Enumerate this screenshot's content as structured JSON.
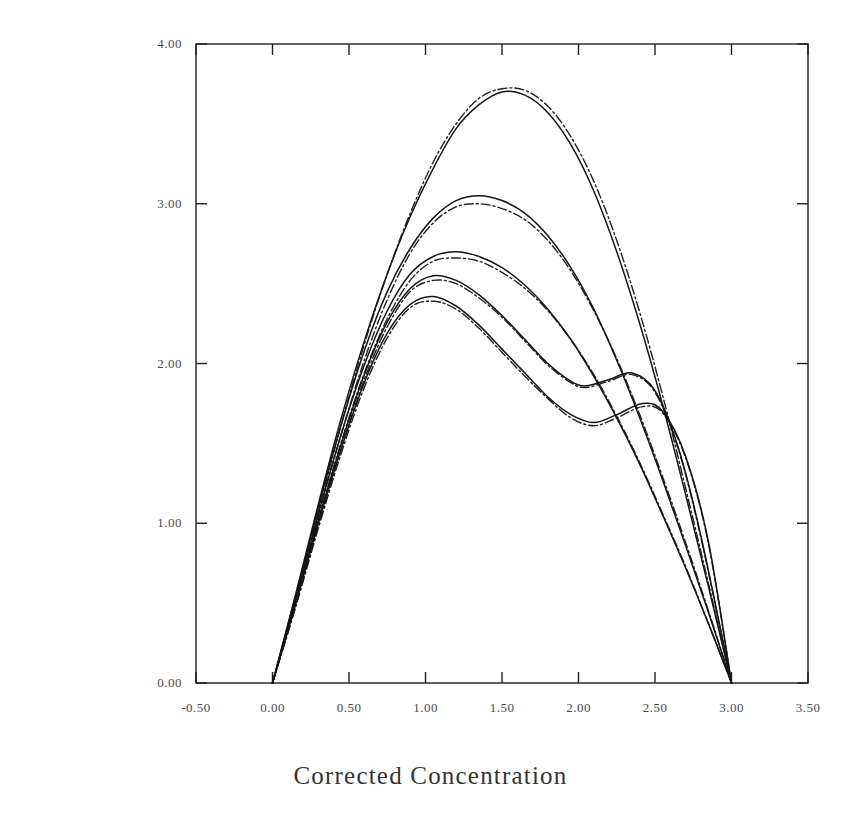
{
  "figure": {
    "name": "corrected-derivative-plot",
    "background_color": "#ffffff",
    "ink_color": "#1a1a1a"
  },
  "chart_data": {
    "type": "line",
    "title": "",
    "xlabel": "Corrected Concentration",
    "ylabel": "Corrected Derivative x 10~--3",
    "xlim": [
      -0.5,
      3.5
    ],
    "ylim": [
      0.0,
      4.0
    ],
    "xticks": [
      "-0.50",
      "0.00",
      "0.50",
      "1.00",
      "1.50",
      "2.00",
      "2.50",
      "3.00",
      "3.50"
    ],
    "xtick_values": [
      -0.5,
      0.0,
      0.5,
      1.0,
      1.5,
      2.0,
      2.5,
      3.0,
      3.5
    ],
    "yticks": [
      "0.00",
      "1.00",
      "2.00",
      "3.00",
      "4.00"
    ],
    "ytick_values": [
      0.0,
      1.0,
      2.0,
      3.0,
      4.0
    ],
    "grid": false,
    "legend": "none",
    "axis_frame": "full-box",
    "series": [
      {
        "name": "curve-1-data",
        "style": "solid",
        "peak_x": 1.55,
        "peak_y": 3.7,
        "x": [
          0.0,
          0.15,
          0.3,
          0.45,
          0.6,
          0.75,
          0.9,
          1.05,
          1.2,
          1.35,
          1.5,
          1.65,
          1.8,
          1.95,
          2.1,
          2.25,
          2.4,
          2.55,
          2.7,
          2.85,
          3.0
        ],
        "y": [
          0.0,
          0.55,
          1.12,
          1.66,
          2.14,
          2.56,
          2.92,
          3.22,
          3.47,
          3.62,
          3.7,
          3.68,
          3.57,
          3.37,
          3.08,
          2.7,
          2.25,
          1.74,
          1.18,
          0.6,
          0.0
        ]
      },
      {
        "name": "curve-1-fit",
        "style": "dashed",
        "peak_x": 1.58,
        "peak_y": 3.72,
        "x": [
          0.0,
          0.15,
          0.3,
          0.45,
          0.6,
          0.75,
          0.9,
          1.05,
          1.2,
          1.35,
          1.5,
          1.65,
          1.8,
          1.95,
          2.1,
          2.25,
          2.4,
          2.55,
          2.7,
          2.85,
          3.0
        ],
        "y": [
          0.0,
          0.52,
          1.08,
          1.62,
          2.12,
          2.56,
          2.94,
          3.26,
          3.5,
          3.66,
          3.72,
          3.71,
          3.61,
          3.42,
          3.14,
          2.77,
          2.32,
          1.8,
          1.22,
          0.62,
          0.0
        ]
      },
      {
        "name": "curve-2-data",
        "style": "solid",
        "peak_x": 1.35,
        "peak_y": 3.05,
        "x": [
          0.0,
          0.15,
          0.3,
          0.45,
          0.6,
          0.75,
          0.9,
          1.05,
          1.2,
          1.35,
          1.5,
          1.65,
          1.8,
          1.95,
          2.1,
          2.25,
          2.4,
          2.55,
          2.7,
          2.85,
          3.0
        ],
        "y": [
          0.0,
          0.54,
          1.1,
          1.62,
          2.08,
          2.45,
          2.72,
          2.91,
          3.02,
          3.05,
          3.02,
          2.94,
          2.8,
          2.6,
          2.34,
          2.02,
          1.66,
          1.27,
          0.86,
          0.44,
          0.0
        ]
      },
      {
        "name": "curve-2-fit",
        "style": "dashed",
        "peak_x": 1.4,
        "peak_y": 3.0,
        "x": [
          0.0,
          0.15,
          0.3,
          0.45,
          0.6,
          0.75,
          0.9,
          1.05,
          1.2,
          1.35,
          1.5,
          1.65,
          1.8,
          1.95,
          2.1,
          2.25,
          2.4,
          2.55,
          2.7,
          2.85,
          3.0
        ],
        "y": [
          0.0,
          0.51,
          1.05,
          1.56,
          2.02,
          2.4,
          2.69,
          2.88,
          2.98,
          3.0,
          2.97,
          2.9,
          2.77,
          2.58,
          2.33,
          2.03,
          1.68,
          1.29,
          0.88,
          0.45,
          0.0
        ]
      },
      {
        "name": "curve-3-data",
        "style": "solid",
        "peak_x": 1.2,
        "peak_y": 2.7,
        "x": [
          0.0,
          0.15,
          0.3,
          0.45,
          0.6,
          0.75,
          0.9,
          1.05,
          1.2,
          1.35,
          1.5,
          1.65,
          1.8,
          1.95,
          2.1,
          2.25,
          2.4,
          2.55,
          2.7,
          2.85,
          3.0
        ],
        "y": [
          0.0,
          0.52,
          1.06,
          1.56,
          1.99,
          2.33,
          2.56,
          2.67,
          2.7,
          2.67,
          2.6,
          2.49,
          2.34,
          2.15,
          1.92,
          1.66,
          1.37,
          1.05,
          0.72,
          0.37,
          0.0
        ]
      },
      {
        "name": "curve-3-fit",
        "style": "dashed",
        "peak_x": 1.25,
        "peak_y": 2.66,
        "x": [
          0.0,
          0.15,
          0.3,
          0.45,
          0.6,
          0.75,
          0.9,
          1.05,
          1.2,
          1.35,
          1.5,
          1.65,
          1.8,
          1.95,
          2.1,
          2.25,
          2.4,
          2.55,
          2.7,
          2.85,
          3.0
        ],
        "y": [
          0.0,
          0.5,
          1.02,
          1.51,
          1.94,
          2.28,
          2.52,
          2.64,
          2.66,
          2.64,
          2.57,
          2.47,
          2.33,
          2.15,
          1.93,
          1.67,
          1.38,
          1.06,
          0.73,
          0.37,
          0.0
        ]
      },
      {
        "name": "curve-4-data",
        "style": "solid",
        "peak_x": 1.1,
        "peak_y": 2.55,
        "shoulder_min_x": 2.05,
        "shoulder_min_y": 1.86,
        "shoulder_max_x": 2.35,
        "shoulder_max_y": 1.94,
        "x": [
          0.0,
          0.15,
          0.3,
          0.45,
          0.6,
          0.75,
          0.9,
          1.05,
          1.2,
          1.35,
          1.5,
          1.65,
          1.8,
          1.95,
          2.05,
          2.2,
          2.35,
          2.5,
          2.65,
          2.8,
          3.0
        ],
        "y": [
          0.0,
          0.5,
          1.02,
          1.5,
          1.93,
          2.26,
          2.47,
          2.55,
          2.52,
          2.43,
          2.3,
          2.15,
          2.0,
          1.89,
          1.86,
          1.9,
          1.94,
          1.83,
          1.48,
          0.92,
          0.0
        ]
      },
      {
        "name": "curve-4-fit",
        "style": "dashed",
        "peak_x": 1.12,
        "peak_y": 2.52,
        "x": [
          0.0,
          0.15,
          0.3,
          0.45,
          0.6,
          0.75,
          0.9,
          1.05,
          1.2,
          1.35,
          1.5,
          1.65,
          1.8,
          1.95,
          2.05,
          2.2,
          2.35,
          2.5,
          2.65,
          2.8,
          3.0
        ],
        "y": [
          0.0,
          0.48,
          0.99,
          1.47,
          1.9,
          2.23,
          2.45,
          2.52,
          2.5,
          2.41,
          2.29,
          2.14,
          1.99,
          1.88,
          1.85,
          1.89,
          1.93,
          1.82,
          1.47,
          0.91,
          0.0
        ]
      },
      {
        "name": "curve-5-data",
        "style": "solid",
        "peak_x": 1.05,
        "peak_y": 2.42,
        "shoulder_min_x": 2.1,
        "shoulder_min_y": 1.63,
        "shoulder_max_x": 2.42,
        "shoulder_max_y": 1.75,
        "x": [
          0.0,
          0.15,
          0.3,
          0.45,
          0.6,
          0.75,
          0.9,
          1.05,
          1.2,
          1.35,
          1.5,
          1.65,
          1.8,
          1.95,
          2.1,
          2.25,
          2.42,
          2.55,
          2.7,
          2.85,
          3.0
        ],
        "y": [
          0.0,
          0.49,
          1.0,
          1.47,
          1.88,
          2.19,
          2.37,
          2.42,
          2.36,
          2.24,
          2.09,
          1.94,
          1.79,
          1.68,
          1.63,
          1.68,
          1.75,
          1.7,
          1.42,
          0.88,
          0.0
        ]
      },
      {
        "name": "curve-5-fit",
        "style": "dashed",
        "peak_x": 1.08,
        "peak_y": 2.39,
        "x": [
          0.0,
          0.15,
          0.3,
          0.45,
          0.6,
          0.75,
          0.9,
          1.05,
          1.2,
          1.35,
          1.5,
          1.65,
          1.8,
          1.95,
          2.1,
          2.25,
          2.42,
          2.55,
          2.7,
          2.85,
          3.0
        ],
        "y": [
          0.0,
          0.47,
          0.97,
          1.44,
          1.85,
          2.16,
          2.35,
          2.39,
          2.34,
          2.22,
          2.07,
          1.92,
          1.78,
          1.66,
          1.61,
          1.66,
          1.73,
          1.69,
          1.41,
          0.87,
          0.0
        ]
      }
    ]
  }
}
